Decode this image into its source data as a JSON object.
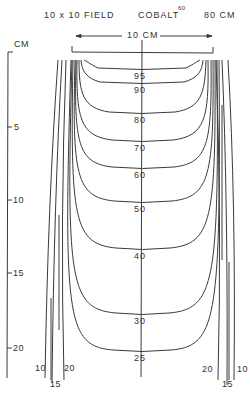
{
  "header": {
    "field_label": "10 x 10  FIELD",
    "source_label": "COBALT",
    "source_superscript": "60",
    "ssd_label": "80  CM"
  },
  "width_annotation": {
    "label": "10  CM",
    "left_arrow": "←",
    "right_arrow": "→"
  },
  "depth_axis": {
    "unit_label": "CM",
    "ticks": [
      {
        "label": "5",
        "depth_cm": 5
      },
      {
        "label": "10",
        "depth_cm": 10
      },
      {
        "label": "15",
        "depth_cm": 15
      },
      {
        "label": "20",
        "depth_cm": 20
      }
    ]
  },
  "isodose_curves": [
    {
      "label": "95",
      "percent": 95
    },
    {
      "label": "90",
      "percent": 90
    },
    {
      "label": "80",
      "percent": 80
    },
    {
      "label": "70",
      "percent": 70
    },
    {
      "label": "60",
      "percent": 60
    },
    {
      "label": "50",
      "percent": 50
    },
    {
      "label": "40",
      "percent": 40
    },
    {
      "label": "30",
      "percent": 30
    },
    {
      "label": "25",
      "percent": 25
    }
  ],
  "edge_curve_labels": {
    "left": [
      "10",
      "15",
      "20"
    ],
    "right": [
      "20",
      "15",
      "10"
    ]
  },
  "colors": {
    "line": "#3a3a3a",
    "background": "#ffffff"
  }
}
